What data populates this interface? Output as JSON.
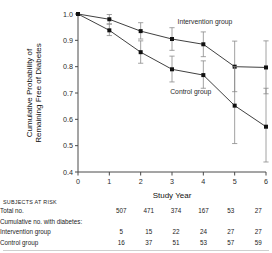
{
  "chart_data": {
    "type": "line",
    "title": "",
    "xlabel": "Study Year",
    "ylabel": "Cumulative Probability of Remaining Free of Diabetes",
    "ylabel_line1": "Cumulative Probability of",
    "ylabel_line2": "Remaining Free of Diabetes",
    "x": [
      0,
      1,
      2,
      3,
      4,
      5,
      6
    ],
    "xlim": [
      0,
      6
    ],
    "ylim": [
      0.4,
      1.0
    ],
    "xticks": [
      "0",
      "1",
      "2",
      "3",
      "4",
      "5",
      "6"
    ],
    "yticks": [
      "0.4",
      "0.5",
      "0.6",
      "0.7",
      "0.8",
      "0.9",
      "1.0"
    ],
    "grid": false,
    "legend_position": "inline-annotation",
    "series": [
      {
        "name": "Intervention group",
        "values": [
          1.0,
          0.98,
          0.935,
          0.905,
          0.885,
          0.8,
          0.797
        ],
        "err_low": [
          1.0,
          0.962,
          0.905,
          0.862,
          0.838,
          0.705,
          0.697
        ],
        "err_high": [
          1.0,
          0.998,
          0.967,
          0.948,
          0.932,
          0.897,
          0.898
        ],
        "label_x": 4.05,
        "label_y": 0.962
      },
      {
        "name": "Control group",
        "values": [
          1.0,
          0.938,
          0.855,
          0.79,
          0.768,
          0.652,
          0.572
        ],
        "err_low": [
          1.0,
          0.918,
          0.813,
          0.742,
          0.718,
          0.508,
          0.438
        ],
        "err_high": [
          1.0,
          0.962,
          0.898,
          0.84,
          0.822,
          0.8,
          0.718
        ],
        "label_x": 3.6,
        "label_y": 0.695
      }
    ]
  },
  "risk_table": {
    "heading": "SUBJECTS AT RISK",
    "rows": [
      {
        "label": "Total no.",
        "indent": false,
        "values": [
          "507",
          "471",
          "374",
          "167",
          "53",
          "27"
        ]
      },
      {
        "label": "Cumulative no. with diabetes:",
        "indent": false,
        "values": [
          "",
          "",
          "",
          "",
          "",
          ""
        ]
      },
      {
        "label": "Intervention group",
        "indent": true,
        "values": [
          "5",
          "15",
          "22",
          "24",
          "27",
          "27"
        ]
      },
      {
        "label": "Control group",
        "indent": true,
        "values": [
          "16",
          "37",
          "51",
          "53",
          "57",
          "59"
        ]
      }
    ]
  }
}
